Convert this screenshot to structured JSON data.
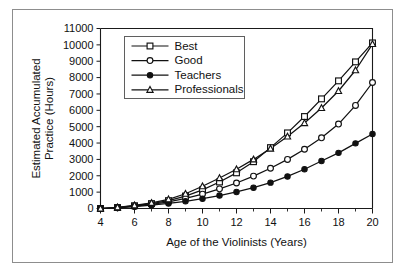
{
  "figure": {
    "background": "#ffffff",
    "frame_color": "#8d8d8d",
    "ink_color": "#111111"
  },
  "chart_data": {
    "type": "line",
    "title": "",
    "xlabel": "Age of the Violinists (Years)",
    "ylabel_line1": "Estimated Accumulated",
    "ylabel_line2": "Practice (Hours)",
    "x": [
      4,
      5,
      6,
      7,
      8,
      9,
      10,
      11,
      12,
      13,
      14,
      15,
      16,
      17,
      18,
      19,
      20
    ],
    "xlim": [
      4,
      20
    ],
    "ylim": [
      0,
      11000
    ],
    "xticks": [
      4,
      6,
      8,
      10,
      12,
      14,
      16,
      18,
      20
    ],
    "xticks_minor": [
      5,
      7,
      9,
      11,
      13,
      15,
      17,
      19
    ],
    "yticks": [
      0,
      1000,
      2000,
      3000,
      4000,
      5000,
      6000,
      7000,
      8000,
      9000,
      10000,
      11000
    ],
    "grid": false,
    "legend_position": "upper-left",
    "series": [
      {
        "name": "Best",
        "marker": "open-square",
        "values": [
          0,
          60,
          170,
          300,
          480,
          760,
          1140,
          1620,
          2180,
          2860,
          3720,
          4620,
          5620,
          6700,
          7800,
          8960,
          10120
        ]
      },
      {
        "name": "Good",
        "marker": "open-circle",
        "values": [
          0,
          50,
          140,
          250,
          400,
          620,
          880,
          1200,
          1560,
          1980,
          2460,
          3000,
          3620,
          4320,
          5160,
          6300,
          7700
        ]
      },
      {
        "name": "Teachers",
        "marker": "filled-circle",
        "values": [
          0,
          40,
          110,
          200,
          310,
          440,
          600,
          790,
          1010,
          1270,
          1580,
          1960,
          2400,
          2900,
          3400,
          3980,
          4550
        ]
      },
      {
        "name": "Professionals",
        "marker": "open-triangle",
        "values": [
          0,
          70,
          190,
          340,
          560,
          900,
          1360,
          1860,
          2400,
          3000,
          3660,
          4400,
          5220,
          6140,
          7180,
          8450,
          10050
        ]
      }
    ]
  },
  "legend": {
    "entries": [
      {
        "label": "Best",
        "marker": "open-square"
      },
      {
        "label": "Good",
        "marker": "open-circle"
      },
      {
        "label": "Teachers",
        "marker": "filled-circle"
      },
      {
        "label": "Professionals",
        "marker": "open-triangle"
      }
    ]
  }
}
